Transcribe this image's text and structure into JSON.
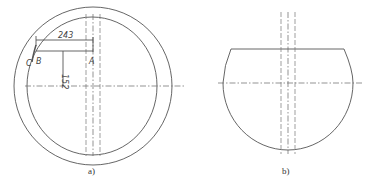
{
  "figure_a": {
    "caption": "a)",
    "dimension_horizontal": "243",
    "dimension_vertical": "152",
    "point_a": "A",
    "point_b": "B",
    "point_c": "C"
  },
  "figure_b": {
    "caption": "b)"
  }
}
